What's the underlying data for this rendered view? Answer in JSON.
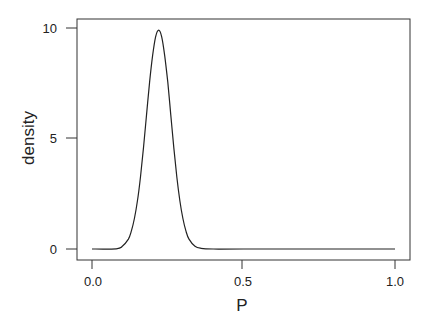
{
  "chart_data": {
    "type": "line",
    "title": "",
    "xlabel": "P",
    "ylabel": "density",
    "xlim": [
      0.0,
      1.0
    ],
    "ylim": [
      0,
      10
    ],
    "x_ticks": [
      "0.0",
      "0.5",
      "1.0"
    ],
    "y_ticks": [
      "0",
      "5",
      "10"
    ],
    "grid": false,
    "legend": null,
    "series": [
      {
        "name": "density",
        "x": [
          0.0,
          0.08,
          0.1,
          0.12,
          0.13,
          0.14,
          0.15,
          0.16,
          0.17,
          0.18,
          0.19,
          0.2,
          0.21,
          0.22,
          0.23,
          0.24,
          0.25,
          0.26,
          0.27,
          0.28,
          0.29,
          0.3,
          0.31,
          0.32,
          0.34,
          0.36,
          0.4,
          0.5,
          1.0
        ],
        "values": [
          0.0,
          0.01,
          0.12,
          0.45,
          0.82,
          1.38,
          2.17,
          3.27,
          4.59,
          6.06,
          7.55,
          8.75,
          9.6,
          9.9,
          9.6,
          8.75,
          7.55,
          6.06,
          4.59,
          3.27,
          2.17,
          1.38,
          0.82,
          0.45,
          0.12,
          0.03,
          0.0,
          0.0,
          0.0
        ]
      }
    ],
    "line_color": "#222222"
  }
}
